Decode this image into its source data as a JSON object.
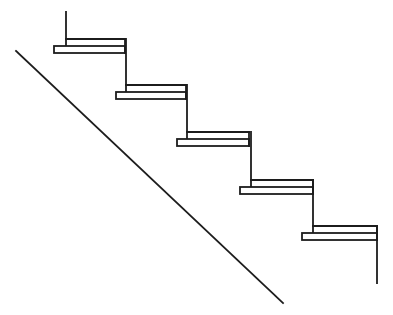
{
  "diagram": {
    "type": "staircase-cross-section",
    "width": 393,
    "height": 315,
    "colors": {
      "line": "#1c1c1c",
      "background": "#ffffff"
    },
    "stringer": {
      "x1": 16,
      "y1": 51,
      "x2": 283,
      "y2": 303
    },
    "start_post": {
      "x": 65,
      "y1": 12,
      "y2": 47
    },
    "end_post": {
      "x": 377,
      "y1": 226,
      "y2": 283
    },
    "steps": [
      {
        "riser_x": 66,
        "riser_top": 12,
        "top_y": 39,
        "mid_y": 46,
        "bot_y": 53,
        "nose_x": 54,
        "end_x": 125
      },
      {
        "riser_x": 126,
        "riser_top": 39,
        "top_y": 85,
        "mid_y": 92,
        "bot_y": 99,
        "nose_x": 116,
        "end_x": 186
      },
      {
        "riser_x": 187,
        "riser_top": 85,
        "top_y": 132,
        "mid_y": 139,
        "bot_y": 146,
        "nose_x": 177,
        "end_x": 249
      },
      {
        "riser_x": 251,
        "riser_top": 132,
        "top_y": 180,
        "mid_y": 187,
        "bot_y": 194,
        "nose_x": 240,
        "end_x": 313
      },
      {
        "riser_x": 313,
        "riser_top": 180,
        "top_y": 226,
        "mid_y": 233,
        "bot_y": 240,
        "nose_x": 302,
        "end_x": 377
      }
    ]
  }
}
